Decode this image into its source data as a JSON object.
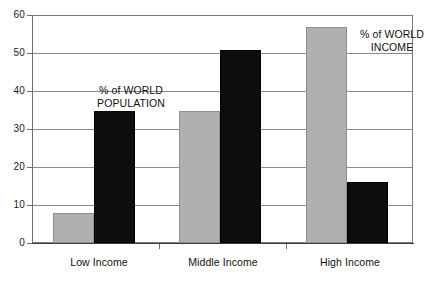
{
  "chart_data": {
    "type": "bar",
    "title": "",
    "subtitle": "",
    "xlabel": "",
    "ylabel": "",
    "categories": [
      "Low Income",
      "Middle Income",
      "High Income"
    ],
    "series": [
      {
        "name": "% of WORLD POPULATION",
        "color": "#b0b0b0",
        "values": [
          8,
          35,
          57
        ]
      },
      {
        "name": "% of WORLD INCOME",
        "color": "#0d0d0d",
        "values": [
          35,
          51,
          16
        ]
      }
    ],
    "ylim": [
      0,
      60
    ],
    "yticks": [
      0,
      10,
      20,
      30,
      40,
      50,
      60
    ],
    "ytick_labels": [
      "0",
      "10",
      "20",
      "30",
      "40",
      "50",
      "60"
    ],
    "grid": true,
    "grid_axis": "y",
    "legend_position": "inline-annotations",
    "annotations": [
      {
        "id": "population",
        "line1": "% of WORLD",
        "line2": "POPULATION"
      },
      {
        "id": "income",
        "line1": "% of WORLD",
        "line2": "INCOME"
      }
    ]
  },
  "axis": {
    "y": {
      "labels": [
        "60",
        "50",
        "40",
        "30",
        "20",
        "10",
        "0"
      ]
    },
    "x": {
      "labels": [
        "Low Income",
        "Middle Income",
        "High Income"
      ]
    }
  },
  "annotations": {
    "population": {
      "line1": "% of WORLD",
      "line2": "POPULATION"
    },
    "income": {
      "line1": "% of WORLD",
      "line2": "INCOME"
    }
  },
  "colors": {
    "population_bar": "#b0b0b0",
    "income_bar": "#0d0d0d",
    "gridline": "#8a8a8a",
    "frame": "#7d7d7d",
    "text": "#111111",
    "background": "#ffffff"
  }
}
